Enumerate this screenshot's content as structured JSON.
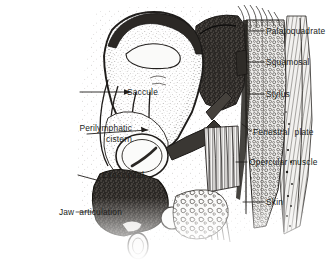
{
  "figure": {
    "kind": "anatomical-cross-section",
    "style": "stippled pen-and-ink line drawing, grayscale",
    "background_color": "#ffffff",
    "ink_color": "#201d1b",
    "width": 332,
    "height": 260
  },
  "labels": [
    {
      "id": "palatoquadrate",
      "text": "Palatoquadrate",
      "side": "right",
      "align": "left",
      "text_x": 266,
      "text_y": 26,
      "leader": {
        "from_x": 264,
        "from_y": 31,
        "to_x": 249,
        "to_y": 31
      }
    },
    {
      "id": "squamosal",
      "text": "Squamosal",
      "side": "right",
      "align": "left",
      "text_x": 266,
      "text_y": 57,
      "leader": {
        "from_x": 264,
        "from_y": 62,
        "to_x": 248,
        "to_y": 62
      }
    },
    {
      "id": "stylus",
      "text": "Stylus",
      "side": "right",
      "align": "left",
      "text_x": 266,
      "text_y": 89,
      "leader": {
        "from_x": 264,
        "from_y": 94,
        "to_x": 249,
        "to_y": 94
      }
    },
    {
      "id": "fenestral-plate",
      "text": "Fenestral  plate",
      "side": "right",
      "align": "left",
      "text_x": 253,
      "text_y": 127,
      "leader": {
        "from_x": 251,
        "from_y": 131,
        "to_x": 242,
        "to_y": 124
      }
    },
    {
      "id": "opercular-muscle",
      "text": "Opercular muscle",
      "side": "right",
      "align": "left",
      "text_x": 249,
      "text_y": 157,
      "leader": {
        "from_x": 247,
        "from_y": 162,
        "to_x": 236,
        "to_y": 162
      }
    },
    {
      "id": "skin",
      "text": "Skin",
      "side": "right",
      "align": "left",
      "text_x": 266,
      "text_y": 197,
      "leader": {
        "from_x": 264,
        "from_y": 202,
        "to_x": 243,
        "to_y": 202
      }
    },
    {
      "id": "saccule",
      "text": "Saccule",
      "side": "left",
      "align": "right",
      "text_x": 40,
      "text_y": 87,
      "leader": {
        "from_x": 80,
        "from_y": 92,
        "to_x": 131,
        "to_y": 92
      }
    },
    {
      "id": "perilymphatic-cistern",
      "text": "Perilymphatic\ncistern",
      "side": "left",
      "align": "right",
      "text_x": 14,
      "text_y": 123,
      "leader": {
        "from_x": 87,
        "from_y": 134,
        "to_x": 148,
        "to_y": 130
      }
    },
    {
      "id": "exoccipital",
      "text": "Exoccipital",
      "side": "left",
      "align": "right",
      "text_x": 26,
      "text_y": 170,
      "leader": {
        "from_x": 78,
        "from_y": 175,
        "to_x": 100,
        "to_y": 181
      }
    },
    {
      "id": "jaw-articulation",
      "text": "Jaw  articulation",
      "side": "left",
      "align": "right",
      "text_x": 4,
      "text_y": 207,
      "leader": {
        "from_x": 76,
        "from_y": 212,
        "to_x": 115,
        "to_y": 212
      }
    }
  ],
  "structures": [
    {
      "id": "braincase-capsule",
      "note": "large pale stippled otic capsule, dark outlined, upper centre"
    },
    {
      "id": "endolymph-duct-oval",
      "note": "elongated pale oval inside capsule"
    },
    {
      "id": "fenestral-ring",
      "note": "circular ring (oval window) lower centre"
    },
    {
      "id": "exoccipital-mass",
      "note": "dense dark granular mass lower centre-left"
    },
    {
      "id": "palatoquadrate-mass",
      "note": "dark stippled mass upper right"
    },
    {
      "id": "cartilage-column",
      "note": "vertical cellular cartilage column on right"
    },
    {
      "id": "opercular-muscle-fibres",
      "note": "striated parallel muscle fibres, centre right"
    },
    {
      "id": "skin-layer",
      "note": "outer skin layer banding along right margin"
    },
    {
      "id": "cancellous-tissue",
      "note": "mottled spongy tissue block lower centre-right"
    }
  ]
}
